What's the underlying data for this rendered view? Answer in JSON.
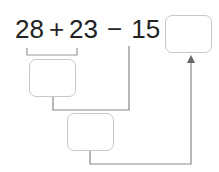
{
  "equation": {
    "a": "28",
    "op1": "+",
    "b": "23",
    "op2": "−",
    "c": "15",
    "equals": "="
  },
  "boxes": [
    {
      "id": "partial-sum-box",
      "value": ""
    },
    {
      "id": "partial-difference-box",
      "value": ""
    },
    {
      "id": "answer-box",
      "value": ""
    }
  ],
  "colors": {
    "text": "#222222",
    "box_border": "#c8c8c8",
    "line": "#888888"
  }
}
